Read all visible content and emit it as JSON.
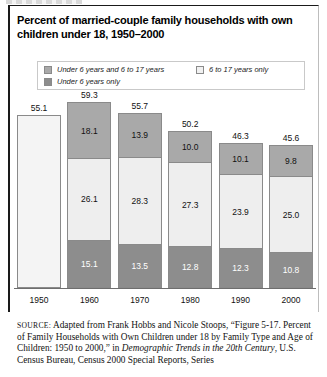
{
  "figure": {
    "title": "Percent of married-couple family households with own children under 18, 1950–2000"
  },
  "legend": {
    "items": [
      {
        "label": "Under 6 years and 6 to 17 years",
        "swatch_color": "#a9a9a9",
        "key": "both"
      },
      {
        "label": "6 to 17 years only",
        "swatch_color": "#f1f1f1",
        "key": "older_only"
      },
      {
        "label": "Under 6 years only",
        "swatch_color": "#8d8d8d",
        "key": "under6_only"
      }
    ]
  },
  "source": {
    "label": "SOURCE:",
    "text_1": " Adapted from Frank Hobbs and Nicole Stoops, “Figure 5-17. Percent of Family Households with Own Children under 18 by Family Type and Age of Children: 1950 to 2000,” in ",
    "italic_1": "Demographic Trends in the 20th Century",
    "text_2": ", U.S. Census Bureau, Census 2000 Special Reports, Series"
  },
  "chart_data": {
    "type": "bar",
    "title": "Percent of married-couple family households with own children under 18, 1950–2000",
    "xlabel": "",
    "ylabel": "",
    "stacked": true,
    "grid": false,
    "legend_position": "top",
    "ylim": [
      0,
      60
    ],
    "categories": [
      "1950",
      "1960",
      "1970",
      "1980",
      "1990",
      "2000"
    ],
    "totals": [
      55.1,
      59.3,
      55.7,
      50.2,
      46.3,
      45.6
    ],
    "series": [
      {
        "name": "Under 6 years only",
        "color": "#8d8d8d",
        "values": [
          null,
          15.1,
          13.5,
          12.8,
          12.3,
          10.8
        ]
      },
      {
        "name": "6 to 17 years only",
        "color": "#eeeeee",
        "values": [
          null,
          26.1,
          28.3,
          27.3,
          23.9,
          25.0
        ]
      },
      {
        "name": "Under 6 years and 6 to 17 years",
        "color": "#a9a9a9",
        "values": [
          null,
          18.1,
          13.9,
          10.0,
          10.1,
          9.8
        ]
      }
    ],
    "bars": [
      {
        "category": "1950",
        "total": "55.1",
        "segments": [
          {
            "key": "plain",
            "value": ""
          }
        ]
      },
      {
        "category": "1960",
        "total": "59.3",
        "segments": [
          {
            "key": "both",
            "value": "18.1"
          },
          {
            "key": "older",
            "value": "26.1"
          },
          {
            "key": "under6",
            "value": "15.1"
          }
        ]
      },
      {
        "category": "1970",
        "total": "55.7",
        "segments": [
          {
            "key": "both",
            "value": "13.9"
          },
          {
            "key": "older",
            "value": "28.3"
          },
          {
            "key": "under6",
            "value": "13.5"
          }
        ]
      },
      {
        "category": "1980",
        "total": "50.2",
        "segments": [
          {
            "key": "both",
            "value": "10.0"
          },
          {
            "key": "older",
            "value": "27.3"
          },
          {
            "key": "under6",
            "value": "12.8"
          }
        ]
      },
      {
        "category": "1990",
        "total": "46.3",
        "segments": [
          {
            "key": "both",
            "value": "10.1"
          },
          {
            "key": "older",
            "value": "23.9"
          },
          {
            "key": "under6",
            "value": "12.3"
          }
        ]
      },
      {
        "category": "2000",
        "total": "45.6",
        "segments": [
          {
            "key": "both",
            "value": "9.8"
          },
          {
            "key": "older",
            "value": "25.0"
          },
          {
            "key": "under6",
            "value": "10.8"
          }
        ]
      }
    ]
  }
}
